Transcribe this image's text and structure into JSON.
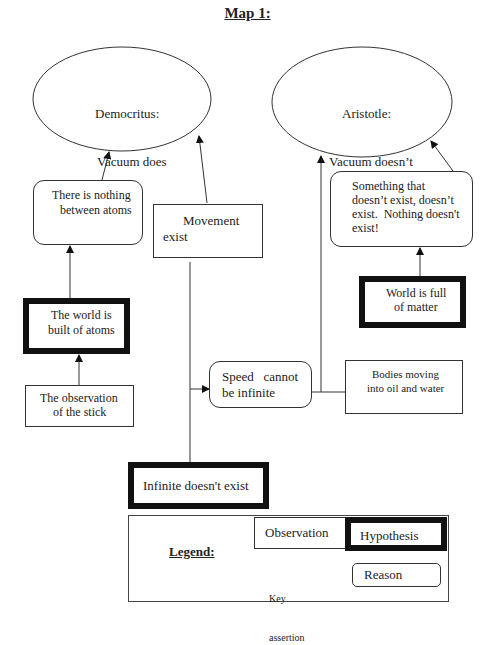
{
  "title": "Map 1:",
  "nodes": {
    "democritus": {
      "type": "key_assertion",
      "lines": [
        "Democritus:",
        "Vacuum does",
        "exist!"
      ]
    },
    "aristotle": {
      "type": "key_assertion",
      "lines": [
        "Aristotle:",
        "Vacuum doesn’t",
        "exist!"
      ]
    },
    "nothing_between": {
      "type": "reason",
      "lines": [
        "There is nothing",
        "between atoms"
      ]
    },
    "movement": {
      "type": "observation",
      "lines": [
        "Movement",
        "exist"
      ]
    },
    "something_that": {
      "type": "reason",
      "lines": [
        "Something that",
        "doesn’t exist, doesn’t",
        "exist.  Nothing doesn't",
        "exist!"
      ]
    },
    "world_atoms": {
      "type": "hypothesis",
      "lines": [
        "The world is",
        "built of atoms"
      ]
    },
    "world_matter": {
      "type": "hypothesis",
      "lines": [
        "World is full",
        "of matter"
      ]
    },
    "observation_stick": {
      "type": "observation",
      "lines": [
        "The observation",
        "of the stick"
      ]
    },
    "speed": {
      "type": "reason",
      "lines": [
        "Speed   cannot",
        "be infinite"
      ]
    },
    "bodies": {
      "type": "observation",
      "lines": [
        "Bodies moving",
        "into oil and water"
      ]
    },
    "infinite": {
      "type": "hypothesis",
      "lines": [
        "Infinite doesn't exist"
      ]
    }
  },
  "edges": [
    {
      "from": "nothing_between",
      "to": "democritus",
      "arrow": true
    },
    {
      "from": "movement",
      "to": "democritus",
      "arrow": true
    },
    {
      "from": "world_atoms",
      "to": "nothing_between",
      "arrow": true
    },
    {
      "from": "observation_stick",
      "to": "world_atoms",
      "arrow": true
    },
    {
      "from": "infinite",
      "to": "speed",
      "arrow": true,
      "via": "movement"
    },
    {
      "from": "speed",
      "to": "aristotle",
      "arrow": true,
      "joined_with": "bodies"
    },
    {
      "from": "bodies",
      "to": "aristotle",
      "arrow": true,
      "joined_with": "speed"
    },
    {
      "from": "world_matter",
      "to": "something_that",
      "arrow": true
    },
    {
      "from": "something_that",
      "to": "aristotle",
      "arrow": true
    }
  ],
  "legend": {
    "title": "Legend:",
    "observation": "Observation",
    "hypothesis": "Hypothesis",
    "key_assertion_lines": [
      "Key",
      "assertion"
    ],
    "reason": "Reason"
  }
}
